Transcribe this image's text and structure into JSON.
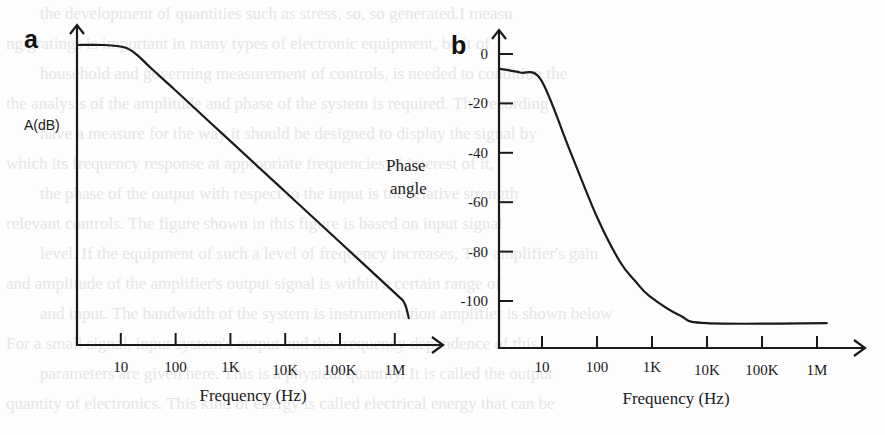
{
  "figure_type": "Bode plot (amplifier frequency response)",
  "chart_data": [
    {
      "panel": "a",
      "type": "line",
      "title": "",
      "xlabel": "Frequency (Hz)",
      "ylabel": "A(dB)",
      "xscale": "log",
      "x_ticks": [
        10,
        100,
        1000,
        10000,
        100000,
        1000000
      ],
      "x_tick_labels": [
        "10",
        "100",
        "1K",
        "10K",
        "100K",
        "1M"
      ],
      "y_ticks": [],
      "y_tick_labels": [],
      "xlim": [
        1.6,
        60000000
      ],
      "ylim": [
        -15,
        105
      ],
      "y_units_note": "relative dB, axis not numerically labeled",
      "grid": false,
      "series": [
        {
          "name": "Gain magnitude",
          "points": [
            [
              1.6,
              100
            ],
            [
              5,
              100
            ],
            [
              12,
              99
            ],
            [
              20,
              96
            ],
            [
              35,
              91
            ],
            [
              100,
              82
            ],
            [
              1000,
              62
            ],
            [
              10000,
              42
            ],
            [
              100000,
              22
            ],
            [
              1000000,
              2
            ],
            [
              1500000,
              -2
            ],
            [
              1800000,
              -8
            ]
          ]
        }
      ]
    },
    {
      "panel": "b",
      "type": "line",
      "title": "",
      "xlabel": "Frequency (Hz)",
      "ylabel": "Phase angle",
      "xscale": "log",
      "x_ticks": [
        10,
        100,
        1000,
        10000,
        100000,
        1000000
      ],
      "x_tick_labels": [
        "10",
        "100",
        "1K",
        "10K",
        "100K",
        "1M"
      ],
      "y_ticks": [
        0,
        -20,
        -40,
        -60,
        -80,
        -100
      ],
      "y_tick_labels": [
        "0",
        "-20",
        "-40",
        "-60",
        "-80",
        "-100"
      ],
      "xlim": [
        1.6,
        60000000
      ],
      "ylim": [
        -119,
        22
      ],
      "grid": false,
      "series": [
        {
          "name": "Phase",
          "points": [
            [
              1.7,
              -6
            ],
            [
              4,
              -7.5
            ],
            [
              9.6,
              -10.5
            ],
            [
              32,
              -39
            ],
            [
              100,
              -66
            ],
            [
              260,
              -84
            ],
            [
              500,
              -92
            ],
            [
              900,
              -98
            ],
            [
              3300,
              -106
            ],
            [
              10000,
              -109
            ],
            [
              1500000,
              -109
            ]
          ]
        }
      ]
    }
  ],
  "labels": {
    "panel_a": "a",
    "panel_b": "b"
  },
  "background_text": [
    "the development of quantities such as stress, so, so generated.I measu",
    "ng gratings is important in many types of electronic equipment, be it of",
    "household and governing measurement of controls, is needed to condition the",
    "the analysis of the amplitude and phase of the system is required. The recording",
    "have a measure for the way it should be designed to display the signal by",
    "which its frequency response at appropriate frequencies of interest of it,",
    "the phase of the output with respect to the input is the relative strength",
    "relevant controls. The figure shown in this figure is based on input signal",
    "level. If the equipment of such a level of frequency increases, The amplifier's gain",
    "and amplitude of the amplifier's output signal is within a certain range of",
    "and input. The bandwidth of the system is instrumentation amplifier is shown below",
    "For a small signal, input system's output and the frequency dependence of this",
    "parameters are given here. This is a physical quantity. It is called the output",
    "quantity of electronics. This kind of energy is called electrical energy that can be"
  ]
}
